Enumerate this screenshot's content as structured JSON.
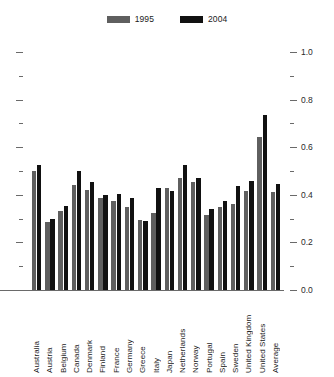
{
  "chart_data": {
    "type": "bar",
    "title": "",
    "subtitle": "",
    "xlabel": "",
    "ylabel": "",
    "ylim": [
      0.0,
      1.0
    ],
    "grid": false,
    "legend_position": "top-center",
    "y_major_ticks": [
      "0.0",
      "0.2",
      "0.4",
      "0.6",
      "0.8",
      "1.0"
    ],
    "y_major_values": [
      0.0,
      0.2,
      0.4,
      0.6,
      0.8,
      1.0
    ],
    "y_minor_values": [
      0.1,
      0.3,
      0.5,
      0.7,
      0.9
    ],
    "left_axis_labeled": false,
    "right_axis_labeled": true,
    "categories": [
      "Australia",
      "Austria",
      "Belgium",
      "Canada",
      "Denmark",
      "Finland",
      "France",
      "Germany",
      "Greece",
      "Italy",
      "Japan",
      "Netherlands",
      "Norway",
      "Portugal",
      "Spain",
      "Sweden",
      "United Kingdom",
      "United States",
      "Average"
    ],
    "series": [
      {
        "name": "1995",
        "color": "#5f5f5f",
        "values": [
          0.5,
          0.285,
          0.33,
          0.44,
          0.42,
          0.385,
          0.375,
          0.35,
          0.295,
          0.325,
          0.43,
          0.47,
          0.455,
          0.315,
          0.35,
          0.36,
          0.415,
          0.645,
          0.41
        ]
      },
      {
        "name": "2004",
        "color": "#111111",
        "values": [
          0.525,
          0.3,
          0.355,
          0.5,
          0.455,
          0.4,
          0.405,
          0.385,
          0.29,
          0.43,
          0.415,
          0.525,
          0.47,
          0.34,
          0.375,
          0.435,
          0.46,
          0.735,
          0.445
        ]
      }
    ]
  },
  "legend": {
    "items": [
      {
        "label": "1995",
        "color": "#5f5f5f"
      },
      {
        "label": "2004",
        "color": "#111111"
      }
    ]
  }
}
